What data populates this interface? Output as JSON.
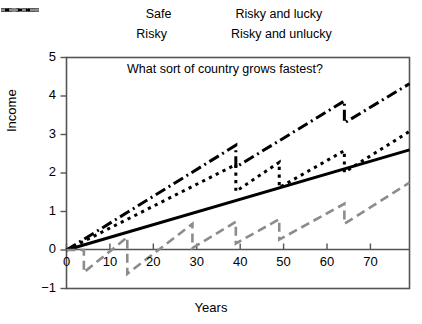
{
  "figure": {
    "title": "What sort of country grows fastest?",
    "xlabel": "Years",
    "ylabel": "Income"
  },
  "legend": {
    "items": [
      {
        "label": "Safe",
        "style": "solid",
        "color": "#000000"
      },
      {
        "label": "Risky and lucky",
        "style": "dashdot",
        "color": "#000000"
      },
      {
        "label": "Risky",
        "style": "dotted",
        "color": "#000000"
      },
      {
        "label": "Risky and unlucky",
        "style": "dashed",
        "color": "#8c8c8c"
      }
    ]
  },
  "axes": {
    "x_ticks": [
      "0",
      "10",
      "20",
      "30",
      "40",
      "50",
      "60",
      "70"
    ],
    "y_ticks": [
      "5",
      "4",
      "3",
      "2",
      "1",
      "0",
      "-1"
    ],
    "x_origin_label": "0"
  },
  "chart_data": {
    "type": "line",
    "title": "What sort of country grows fastest?",
    "xlabel": "Years",
    "ylabel": "Income",
    "xlim": [
      0,
      79
    ],
    "ylim": [
      -1,
      5
    ],
    "grid": false,
    "legend_position": "top",
    "series": [
      {
        "name": "Safe",
        "style": "solid",
        "color": "#000000",
        "x": [
          0,
          79
        ],
        "y": [
          0,
          2.6
        ]
      },
      {
        "name": "Risky and lucky",
        "style": "dashdot",
        "color": "#000000",
        "x": [
          0,
          39,
          39,
          64,
          64,
          79
        ],
        "y": [
          0,
          2.72,
          2.15,
          3.87,
          3.3,
          4.32
        ]
      },
      {
        "name": "Risky",
        "style": "dotted",
        "color": "#000000",
        "x": [
          0,
          39,
          39,
          49,
          49,
          64,
          64,
          79
        ],
        "y": [
          0,
          2.22,
          1.52,
          2.28,
          1.62,
          2.58,
          2.02,
          3.08
        ]
      },
      {
        "name": "Risky and unlucky",
        "style": "dashed",
        "color": "#8c8c8c",
        "x": [
          0,
          4,
          4,
          14,
          14,
          29,
          29,
          39,
          39,
          49,
          49,
          64,
          64,
          79
        ],
        "y": [
          0,
          0.0,
          -0.58,
          0.33,
          -0.62,
          0.68,
          0.05,
          0.73,
          0.17,
          0.8,
          0.27,
          1.2,
          0.68,
          1.75
        ]
      }
    ]
  }
}
